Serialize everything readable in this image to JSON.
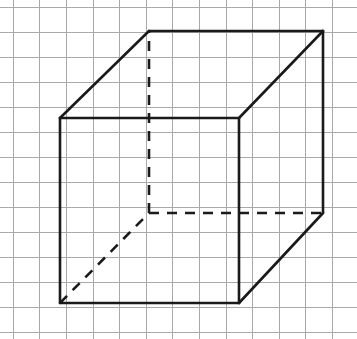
{
  "figure": {
    "canvas": {
      "width": 357,
      "height": 339,
      "background": "#ffffff"
    },
    "grid": {
      "line_color": "#a9a9a9",
      "line_width": 1,
      "column_spacing": 26.6,
      "row_spacing": 25.0,
      "first_column_x": 12.7,
      "first_row_y": 6.5,
      "column_count": 14,
      "row_count": 14
    },
    "shape": {
      "name": "cube",
      "projection": "oblique",
      "edge_color": "#1a1a1a",
      "edge_width": 2.6,
      "hidden_edge_style": "dashed",
      "hidden_dash_pattern": "10 8",
      "depth_offset_x": 89,
      "depth_offset_y": -87,
      "front_face_side_px": 185,
      "vertices": {
        "front_top_left": {
          "x": 60,
          "y": 118
        },
        "front_top_right": {
          "x": 239,
          "y": 118
        },
        "front_bottom_right": {
          "x": 239,
          "y": 303
        },
        "front_bottom_left": {
          "x": 60,
          "y": 303
        },
        "back_top_left": {
          "x": 149,
          "y": 31
        },
        "back_top_right": {
          "x": 323,
          "y": 31
        },
        "back_bottom_right": {
          "x": 323,
          "y": 213
        },
        "back_bottom_left": {
          "x": 149,
          "y": 213
        }
      },
      "visible_edges": [
        {
          "name": "front-top-edge",
          "from": "front_top_left",
          "to": "front_top_right"
        },
        {
          "name": "front-right-edge",
          "from": "front_top_right",
          "to": "front_bottom_right"
        },
        {
          "name": "front-bottom-edge",
          "from": "front_bottom_right",
          "to": "front_bottom_left"
        },
        {
          "name": "front-left-edge",
          "from": "front_bottom_left",
          "to": "front_top_left"
        },
        {
          "name": "back-top-edge",
          "from": "back_top_left",
          "to": "back_top_right"
        },
        {
          "name": "back-right-edge",
          "from": "back_top_right",
          "to": "back_bottom_right"
        },
        {
          "name": "top-left-depth-edge",
          "from": "front_top_left",
          "to": "back_top_left"
        },
        {
          "name": "top-right-depth-edge",
          "from": "front_top_right",
          "to": "back_top_right"
        },
        {
          "name": "bottom-right-depth-edge",
          "from": "front_bottom_right",
          "to": "back_bottom_right"
        }
      ],
      "hidden_edges": [
        {
          "name": "back-left-vertical-edge",
          "from": "back_bottom_left",
          "to": "back_top_left"
        },
        {
          "name": "back-bottom-edge",
          "from": "back_bottom_left",
          "to": "back_bottom_right"
        },
        {
          "name": "bottom-left-depth-edge",
          "from": "front_bottom_left",
          "to": "back_bottom_left"
        }
      ]
    }
  }
}
